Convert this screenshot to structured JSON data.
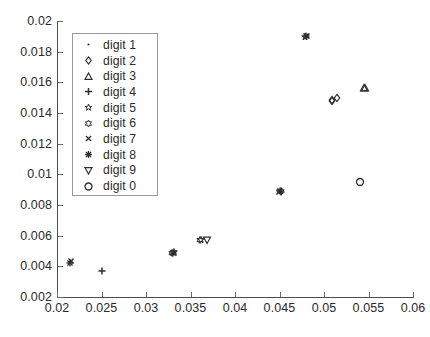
{
  "chart_data": {
    "type": "scatter",
    "title": "",
    "xlabel": "",
    "ylabel": "",
    "xlim": [
      0.02,
      0.06
    ],
    "ylim": [
      0.002,
      0.02
    ],
    "grid": false,
    "legend_position": "upper left",
    "xticks": [
      "0.02",
      "0.025",
      "0.03",
      "0.035",
      "0.04",
      "0.045",
      "0.05",
      "0.055",
      "0.06"
    ],
    "xtick_values": [
      0.02,
      0.025,
      0.03,
      0.035,
      0.04,
      0.045,
      0.05,
      0.055,
      0.06
    ],
    "yticks": [
      "0.002",
      "0.004",
      "0.006",
      "0.008",
      "0.01",
      "0.012",
      "0.014",
      "0.016",
      "0.018",
      "0.02"
    ],
    "ytick_values": [
      0.002,
      0.004,
      0.006,
      0.008,
      0.01,
      0.012,
      0.014,
      0.016,
      0.018,
      0.02
    ],
    "marker_color": "#2e2e2e",
    "series": [
      {
        "name": "digit 1",
        "marker": "point",
        "x": [
          0.02145
        ],
        "y": [
          0.00432
        ]
      },
      {
        "name": "digit 2",
        "marker": "diamond",
        "x": [
          0.05085
        ],
        "y": [
          0.0148
        ]
      },
      {
        "name": "digit 3",
        "marker": "triangle-up",
        "x": [
          0.05455
        ],
        "y": [
          0.0156
        ]
      },
      {
        "name": "digit 4",
        "marker": "plus",
        "x": [
          0.02505
        ],
        "y": [
          0.00372
        ]
      },
      {
        "name": "digit 5",
        "marker": "pentagram",
        "x": [
          0.0361
        ],
        "y": [
          0.0057
        ]
      },
      {
        "name": "digit 6",
        "marker": "hexagram",
        "x": [
          0.03625
        ],
        "y": [
          0.00572
        ]
      },
      {
        "name": "digit 7",
        "marker": "cross",
        "x": [
          0.02155
        ],
        "y": [
          0.00428
        ]
      },
      {
        "name": "digit 8",
        "marker": "asterisk",
        "x": [
          0.048
        ],
        "y": [
          0.019
        ]
      },
      {
        "name": "digit 9",
        "marker": "triangle-down",
        "x": [
          0.0369
        ],
        "y": [
          0.0057
        ]
      },
      {
        "name": "digit 0",
        "marker": "circle",
        "x": [
          0.054
        ],
        "y": [
          0.0095
        ]
      }
    ],
    "clusters": [
      {
        "x": 0.0215,
        "y": 0.0043,
        "markers": [
          "point",
          "cross",
          "asterisk"
        ]
      },
      {
        "x": 0.02505,
        "y": 0.00372,
        "markers": [
          "plus"
        ]
      },
      {
        "x": 0.03305,
        "y": 0.0049,
        "markers": [
          "asterisk",
          "pentagram",
          "hexagram",
          "cross"
        ]
      },
      {
        "x": 0.0361,
        "y": 0.0057,
        "markers": [
          "hexagram",
          "pentagram"
        ]
      },
      {
        "x": 0.0369,
        "y": 0.0057,
        "markers": [
          "triangle-down"
        ]
      },
      {
        "x": 0.04505,
        "y": 0.0089,
        "markers": [
          "asterisk",
          "pentagram",
          "cross",
          "plus"
        ]
      },
      {
        "x": 0.048,
        "y": 0.019,
        "markers": [
          "asterisk",
          "cross",
          "pentagram"
        ]
      },
      {
        "x": 0.05085,
        "y": 0.0148,
        "markers": [
          "diamond",
          "diamond"
        ]
      },
      {
        "x": 0.0515,
        "y": 0.01495,
        "markers": [
          "diamond"
        ]
      },
      {
        "x": 0.054,
        "y": 0.0095,
        "markers": [
          "circle"
        ]
      },
      {
        "x": 0.05455,
        "y": 0.0156,
        "markers": [
          "triangle-up",
          "triangle-up"
        ]
      }
    ]
  },
  "legend": {
    "items": [
      {
        "label": "digit 1",
        "marker": "point"
      },
      {
        "label": "digit 2",
        "marker": "diamond"
      },
      {
        "label": "digit 3",
        "marker": "triangle-up"
      },
      {
        "label": "digit 4",
        "marker": "plus"
      },
      {
        "label": "digit 5",
        "marker": "pentagram"
      },
      {
        "label": "digit 6",
        "marker": "hexagram"
      },
      {
        "label": "digit 7",
        "marker": "cross"
      },
      {
        "label": "digit 8",
        "marker": "asterisk"
      },
      {
        "label": "digit 9",
        "marker": "triangle-down"
      },
      {
        "label": "digit 0",
        "marker": "circle"
      }
    ]
  }
}
